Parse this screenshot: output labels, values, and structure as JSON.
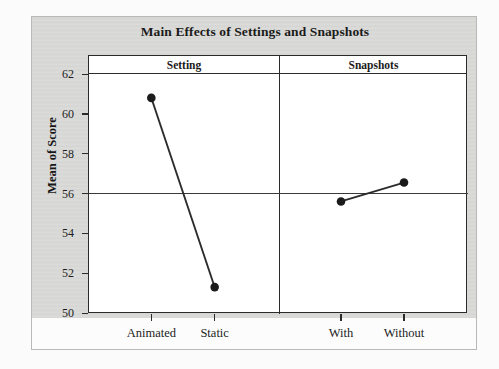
{
  "figure": {
    "title": "Main Effects of Settings and Snapshots",
    "background_color": "#d8d8d6",
    "frame_color": "#b9b9b9",
    "axis_color": "#2b2b2b"
  },
  "chart_data": {
    "type": "line",
    "title": "Main Effects of Settings and Snapshots",
    "subtitle": "",
    "xlabel": "",
    "ylabel": "Mean of Score",
    "ylim": [
      50,
      62
    ],
    "yticks": [
      50,
      52,
      54,
      56,
      58,
      60,
      62
    ],
    "ytick_labels": [
      "50",
      "52",
      "54",
      "56",
      "58",
      "60",
      "62"
    ],
    "grid": false,
    "legend": "none",
    "reference_line": {
      "value": 56,
      "label": "56",
      "orientation": "horizontal",
      "spans_all_panels": true
    },
    "panels": [
      {
        "name": "Setting",
        "categories": [
          "Animated",
          "Static"
        ],
        "values": [
          60.8,
          51.3
        ]
      },
      {
        "name": "Snapshots",
        "categories": [
          "With",
          "Without"
        ],
        "values": [
          55.6,
          56.55
        ]
      }
    ],
    "marker": "filled-circle",
    "marker_color": "#1b1b1b",
    "line_color": "#2b2b2b"
  }
}
